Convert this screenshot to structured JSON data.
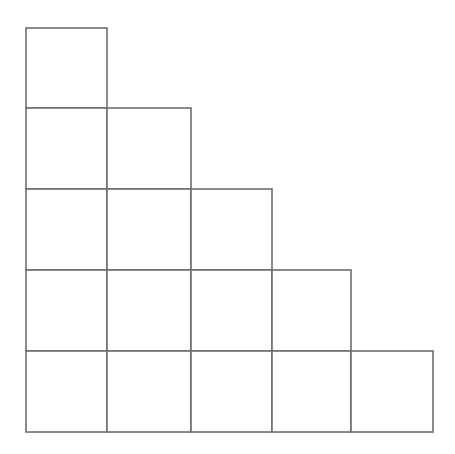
{
  "diagram": {
    "type": "staircase-grid",
    "row_counts": [
      1,
      2,
      3,
      4,
      5
    ],
    "total_squares": 15,
    "colors": {
      "line": "#6e6e6e",
      "fill": "#ffffff"
    },
    "col_edges": [
      26,
      107,
      191,
      272,
      351,
      433
    ],
    "row_edges": [
      28,
      108,
      189,
      270,
      351,
      432
    ]
  }
}
